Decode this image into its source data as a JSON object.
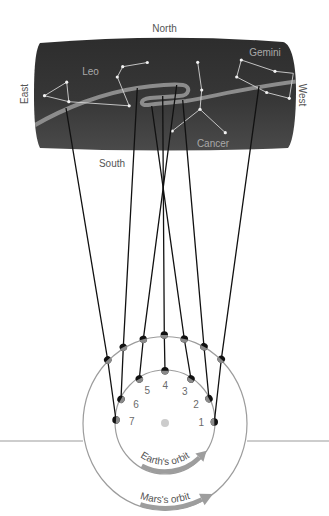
{
  "figure": {
    "directions": {
      "north": "North",
      "south": "South",
      "east": "East",
      "west": "West"
    },
    "constellations": {
      "leo": "Leo",
      "gemini": "Gemini",
      "cancer": "Cancer"
    },
    "positions": [
      "1",
      "2",
      "3",
      "4",
      "5",
      "6",
      "7"
    ],
    "orbits": {
      "earth": "Earth's orbit",
      "mars": "Mars's orbit"
    }
  },
  "colors": {
    "sky_panel": "#383838",
    "ecliptic_path": "#8c8c8c",
    "constellation_lines": "#d2d2d2",
    "sight_lines": "#111111",
    "orbits": "#9c9c9c",
    "sun": "#cccccc",
    "labels": "#555555"
  }
}
